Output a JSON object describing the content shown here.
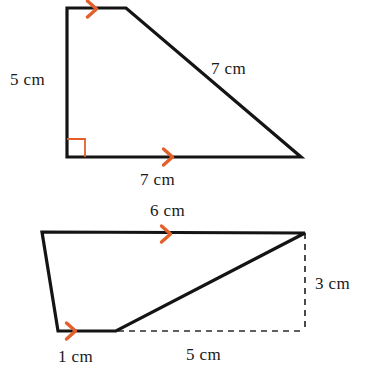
{
  "figure": {
    "background_color": "#ffffff",
    "stroke_color": "#141414",
    "arrow_color": "#e2602c",
    "right_angle_color": "#e2602c",
    "dashed_color": "#2b2b2b",
    "shapes": [
      {
        "name": "right-trapezoid-top",
        "kind": "quadrilateral",
        "vertices": [
          {
            "id": "A",
            "x": 67,
            "y": 8
          },
          {
            "id": "B",
            "x": 126,
            "y": 8
          },
          {
            "id": "C",
            "x": 301,
            "y": 157
          },
          {
            "id": "D",
            "x": 67,
            "y": 157
          }
        ],
        "has_right_angle": true,
        "right_angle_at": "D",
        "labels": [
          {
            "name": "left-side-label",
            "text": "5 cm",
            "x": 10,
            "y": 85
          },
          {
            "name": "slant-side-label",
            "text": "7 cm",
            "x": 211,
            "y": 74
          },
          {
            "name": "bottom-side-label",
            "text": "7 cm",
            "x": 140,
            "y": 185
          }
        ],
        "arrows": [
          {
            "name": "arrow-top-edge",
            "x": 92,
            "y": 9,
            "direction": "right"
          },
          {
            "name": "arrow-bottom-edge",
            "x": 168,
            "y": 157,
            "direction": "right"
          }
        ]
      },
      {
        "name": "irregular-quadrilateral-bottom",
        "kind": "quadrilateral",
        "vertices": [
          {
            "id": "E",
            "x": 42,
            "y": 232
          },
          {
            "id": "F",
            "x": 305,
            "y": 233
          },
          {
            "id": "G",
            "x": 116,
            "y": 331
          },
          {
            "id": "H",
            "x": 58,
            "y": 331
          }
        ],
        "has_right_angle": false,
        "labels": [
          {
            "name": "top-side-label",
            "text": "6 cm",
            "x": 150,
            "y": 216
          },
          {
            "name": "height-label",
            "text": "3 cm",
            "x": 315,
            "y": 289
          },
          {
            "name": "short-base-label",
            "text": "1 cm",
            "x": 58,
            "y": 362
          },
          {
            "name": "dashed-base-label",
            "text": "5 cm",
            "x": 186,
            "y": 360
          }
        ],
        "arrows": [
          {
            "name": "arrow-top-edge",
            "x": 166,
            "y": 234,
            "direction": "right"
          },
          {
            "name": "arrow-short-base-edge",
            "x": 71,
            "y": 331,
            "direction": "right"
          }
        ],
        "dashed_guides": [
          {
            "name": "dashed-vertical-height",
            "x1": 305,
            "y1": 233,
            "x2": 305,
            "y2": 331
          },
          {
            "name": "dashed-horizontal-base",
            "x1": 118,
            "y1": 331,
            "x2": 305,
            "y2": 331
          }
        ]
      }
    ]
  }
}
